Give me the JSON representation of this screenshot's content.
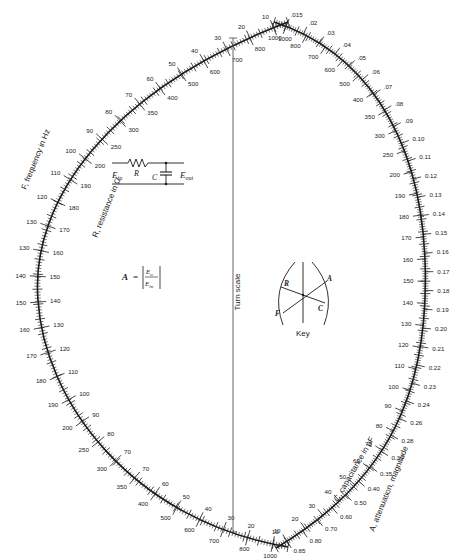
{
  "left_scale": {
    "outer_title": "F, frequency in Hz",
    "inner_title": "R, resistance in Ω",
    "outer_labels": [
      "10",
      "20",
      "30",
      "40",
      "50",
      "60",
      "70",
      "80",
      "90",
      "100",
      "110",
      "120",
      "130",
      "140",
      "150",
      "160",
      "170",
      "180",
      "190",
      "200",
      "250",
      "300",
      "350",
      "400",
      "500",
      "600",
      "700",
      "800",
      "1000"
    ],
    "outer_labels_bottom": [
      "10",
      "20",
      "30",
      "40",
      "50",
      "60",
      "70"
    ],
    "top_outer_labels": [
      "10",
      "20",
      "30",
      "40",
      "50",
      "60",
      "70",
      "80",
      "90",
      "100",
      "110",
      "120",
      "130"
    ],
    "top_inner_labels": [
      "1000",
      "800",
      "700",
      "600",
      "500",
      "400",
      "350",
      "300",
      "250",
      "200",
      "190",
      "180",
      "170",
      "160",
      "150",
      "140",
      "130",
      "120",
      "110",
      "100",
      "90",
      "80",
      "70"
    ],
    "bottom_outer_labels": [
      "130",
      "140",
      "150",
      "160",
      "170",
      "180",
      "190",
      "200",
      "250",
      "300",
      "350",
      "400",
      "500",
      "600",
      "700",
      "800",
      "1000"
    ],
    "bottom_inner_labels": [
      "70",
      "60",
      "50",
      "40",
      "30",
      "20",
      "10"
    ]
  },
  "right_scale": {
    "outer_title": "A, attenuation, magnitude",
    "inner_title": "C, capacitance in μF",
    "top_outer_labels": [
      ".015",
      ".02",
      ".03",
      ".04",
      ".05",
      ".06",
      ".07",
      ".08",
      ".09",
      "0.10",
      "0.11",
      "0.12",
      "0.13",
      "0.14",
      "0.15",
      "0.16",
      "0.17",
      "0.18",
      "0.19",
      "0.20",
      "0.21",
      "0.22",
      "0.23",
      "0.24",
      "0.26",
      "0.28",
      "0.30",
      "0.35",
      "0.40",
      "0.50",
      "0.60",
      "0.70",
      "0.80",
      "0.85"
    ],
    "inner_labels": [
      "1000",
      "800",
      "700",
      "600",
      "500",
      "400",
      "350",
      "300",
      "250",
      "200",
      "190",
      "180",
      "170",
      "160",
      "150",
      "140",
      "130",
      "120",
      "110",
      "100",
      "90",
      "80",
      "70",
      "60",
      "50",
      "40",
      "30",
      "20",
      "10"
    ]
  },
  "turn_scale": {
    "label": "Turn scale"
  },
  "circuit": {
    "e_in": "E",
    "e_in_sub": "in",
    "resistor": "R",
    "capacitor": "C",
    "e_out": "E",
    "e_out_sub": "out"
  },
  "formula": {
    "lhs": "A",
    "eq": "=",
    "num": "E",
    "num_sub": "o",
    "den": "E",
    "den_sub": "in"
  },
  "key": {
    "title": "Key",
    "labels": {
      "R": "R",
      "A": "A",
      "F": "F",
      "C": "C"
    }
  }
}
